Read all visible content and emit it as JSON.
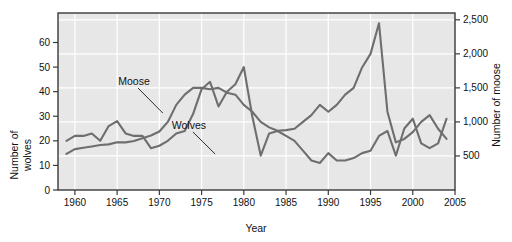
{
  "chart_data": {
    "type": "line",
    "title": "",
    "xlabel": "Year",
    "ylabel_left_line1": "Number of",
    "ylabel_left_line2": "wolves",
    "ylabel_right": "Number of moose",
    "grid": true,
    "legend_position": "inline-annotations",
    "background_color": "#e7e7e7",
    "line_color": "#6e6e6e",
    "frame_color": "#3a3a3a",
    "gridline_color": "#ffffff",
    "xlim": [
      1958,
      2005
    ],
    "xticks": [
      1960,
      1965,
      1970,
      1975,
      1980,
      1985,
      1990,
      1995,
      2000,
      2005
    ],
    "xtick_labels": [
      "1960",
      "1965",
      "1970",
      "1975",
      "1980",
      "1985",
      "1990",
      "1995",
      "2000",
      "2005"
    ],
    "left_axis": {
      "label": "Number of wolves",
      "ylim": [
        0,
        72
      ],
      "ticks": [
        0,
        10,
        20,
        30,
        40,
        50,
        60
      ],
      "tick_labels": [
        "0",
        "10",
        "20",
        "30",
        "40",
        "50",
        "60"
      ]
    },
    "right_axis": {
      "label": "Number of moose",
      "ylim": [
        0,
        2600
      ],
      "ticks": [
        500,
        1000,
        1500,
        2000,
        2500
      ],
      "tick_labels": [
        "500",
        "1,000",
        "1,500",
        "2,000",
        "2,500"
      ]
    },
    "annotations": [
      {
        "text": "Moose",
        "x": 1967.0,
        "y_px": 85,
        "leader_to_x": 1970.4,
        "leader_to_y_px": 113
      },
      {
        "text": "Wolves",
        "x": 1973.5,
        "y_px": 129,
        "leader_to_x": 1976.6,
        "leader_to_y_px": 154
      }
    ],
    "series": [
      {
        "name": "Wolves",
        "axis": "left",
        "x": [
          1959,
          1960,
          1961,
          1962,
          1963,
          1964,
          1965,
          1966,
          1967,
          1968,
          1969,
          1970,
          1971,
          1972,
          1973,
          1974,
          1975,
          1976,
          1977,
          1978,
          1979,
          1980,
          1981,
          1982,
          1983,
          1984,
          1985,
          1986,
          1987,
          1988,
          1989,
          1990,
          1991,
          1992,
          1993,
          1994,
          1995,
          1996,
          1997,
          1998,
          1999,
          2000,
          2001,
          2002,
          2003,
          2004
        ],
        "values": [
          20,
          22,
          22,
          23,
          20,
          26,
          28,
          23,
          22,
          22,
          17,
          18,
          20,
          23,
          24,
          31,
          41,
          44,
          34,
          40,
          43,
          50,
          30,
          14,
          23,
          24,
          22,
          20,
          16,
          12,
          11,
          15,
          12,
          12,
          13,
          15,
          16,
          22,
          24,
          14,
          25,
          29,
          19,
          17,
          19,
          29
        ]
      },
      {
        "name": "Moose",
        "axis": "right",
        "x": [
          1959,
          1960,
          1961,
          1962,
          1963,
          1964,
          1965,
          1966,
          1967,
          1968,
          1969,
          1970,
          1971,
          1972,
          1973,
          1974,
          1975,
          1976,
          1977,
          1978,
          1979,
          1980,
          1981,
          1982,
          1983,
          1984,
          1985,
          1986,
          1987,
          1988,
          1989,
          1990,
          1991,
          1992,
          1993,
          1994,
          1995,
          1996,
          1997,
          1998,
          1999,
          2000,
          2001,
          2002,
          2003,
          2004
        ],
        "values": [
          530,
          600,
          620,
          640,
          660,
          670,
          700,
          700,
          720,
          760,
          800,
          860,
          1000,
          1250,
          1400,
          1500,
          1500,
          1480,
          1500,
          1430,
          1400,
          1250,
          1150,
          1000,
          920,
          870,
          880,
          900,
          1000,
          1100,
          1250,
          1150,
          1250,
          1400,
          1500,
          1800,
          2000,
          2450,
          1150,
          700,
          750,
          850,
          1000,
          1100,
          900,
          750
        ]
      }
    ]
  }
}
